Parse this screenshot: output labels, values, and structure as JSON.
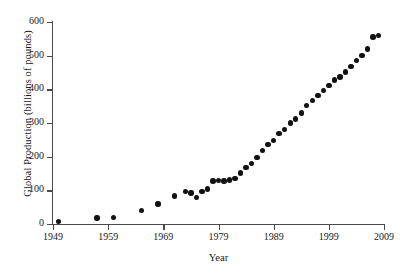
{
  "chart_data": {
    "type": "scatter",
    "title": "",
    "xlabel": "Year",
    "ylabel": "Global Production (billions of pounds)",
    "xlim": [
      1949,
      2009
    ],
    "ylim": [
      0,
      600
    ],
    "xticks": [
      1949,
      1959,
      1969,
      1979,
      1989,
      1999,
      2009
    ],
    "xtick_labels": [
      "1949",
      "1959",
      "1969",
      "1979",
      "1989",
      "1999",
      "2009"
    ],
    "yticks": [
      0,
      100,
      200,
      300,
      400,
      500,
      600
    ],
    "ytick_labels": [
      "0",
      "100",
      "200",
      "300",
      "400",
      "500",
      "600"
    ],
    "grid": false,
    "legend": null,
    "marker": "filled-circle",
    "marker_color": "#111111",
    "axis_color": "#4a4a4a",
    "background": "#ffffff",
    "x": [
      1950,
      1957,
      1960,
      1965,
      1968,
      1971,
      1973,
      1974,
      1975,
      1976,
      1977,
      1978,
      1979,
      1980,
      1981,
      1982,
      1983,
      1984,
      1985,
      1986,
      1987,
      1988,
      1989,
      1990,
      1991,
      1992,
      1993,
      1994,
      1995,
      1996,
      1997,
      1998,
      1999,
      2000,
      2001,
      2002,
      2003,
      2004,
      2005,
      2006,
      2007,
      2008
    ],
    "y": [
      7,
      18,
      20,
      40,
      60,
      83,
      96,
      92,
      78,
      96,
      104,
      128,
      130,
      128,
      131,
      136,
      152,
      168,
      180,
      198,
      218,
      236,
      248,
      268,
      281,
      300,
      312,
      330,
      352,
      366,
      382,
      396,
      412,
      428,
      437,
      452,
      468,
      486,
      500,
      520,
      556,
      560,
      520
    ]
  }
}
